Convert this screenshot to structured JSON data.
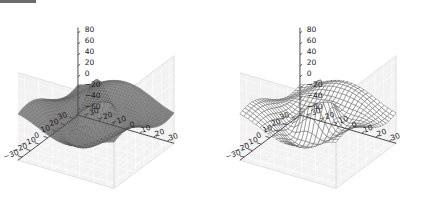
{
  "figure": {
    "background_color": "#ffffff",
    "pane_color": "#f2f2f2",
    "grid_color": "#ffffff",
    "axis_line_color": "#4d4d4d",
    "tick_label_color": "#1a1a1a",
    "header_bar_color": "#6b6b6b",
    "tick_font_size": 7.5
  },
  "chart_data": [
    {
      "type": "surface3d",
      "name": "left-surface-plot",
      "title": "",
      "xlabel": "",
      "ylabel": "",
      "zlabel": "",
      "render_style": "filled-surface-with-mesh",
      "mesh_color": "#4a4a4a",
      "face_color": "#8a8a8a",
      "mesh_rows": 40,
      "mesh_cols": 40,
      "grid": true,
      "legend": "none",
      "xlim": [
        -35,
        35
      ],
      "ylim": [
        -35,
        35
      ],
      "zlim": [
        -70,
        90
      ],
      "xticks": [
        -30,
        -20,
        -10,
        0,
        10,
        20,
        30
      ],
      "xtick_labels": [
        "−30",
        "−20",
        "−10",
        "0",
        "10",
        "20",
        "30"
      ],
      "yticks": [
        30,
        20,
        10,
        0,
        -10,
        -20,
        -30
      ],
      "ytick_labels": [
        "30",
        "20",
        "10",
        "0",
        "−10",
        "−20",
        "−30"
      ],
      "zticks": [
        80,
        60,
        40,
        20,
        0,
        -20,
        -40,
        -60
      ],
      "ztick_labels": [
        "80",
        "60",
        "40",
        "20",
        "0",
        "−20",
        "−40",
        "−60"
      ],
      "view": {
        "elev": 28,
        "azim": -58
      },
      "function": "z = 60*exp(-(r/18)^2)*cos(r/7) + 22*sin(x/15)*cos(y/13)",
      "z_min_observed": -62,
      "z_max_observed": 85
    },
    {
      "type": "surface3d",
      "name": "right-wireframe-plot",
      "title": "",
      "xlabel": "",
      "ylabel": "",
      "zlabel": "",
      "render_style": "wireframe",
      "mesh_color": "#5a5a5a",
      "face_color": "none",
      "mesh_rows": 24,
      "mesh_cols": 24,
      "grid": true,
      "legend": "none",
      "xlim": [
        -35,
        35
      ],
      "ylim": [
        -35,
        35
      ],
      "zlim": [
        -70,
        90
      ],
      "xticks": [
        -30,
        -20,
        -10,
        0,
        10,
        20,
        30
      ],
      "xtick_labels": [
        "−30",
        "−20",
        "−10",
        "0",
        "10",
        "20",
        "30"
      ],
      "yticks": [
        30,
        20,
        10,
        0,
        -10,
        -20,
        -30
      ],
      "ytick_labels": [
        "30",
        "20",
        "10",
        "0",
        "−10",
        "−20",
        "−30"
      ],
      "zticks": [
        80,
        60,
        40,
        20,
        0,
        -20,
        -40,
        -60
      ],
      "ztick_labels": [
        "80",
        "60",
        "40",
        "20",
        "0",
        "−20",
        "−40",
        "−60"
      ],
      "view": {
        "elev": 28,
        "azim": -58
      },
      "function": "z = 60*exp(-(r/18)^2)*cos(r/7) + 22*sin(x/15)*cos(y/13)",
      "z_min_observed": -62,
      "z_max_observed": 85
    }
  ]
}
